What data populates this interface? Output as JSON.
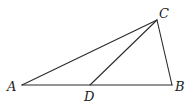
{
  "diagram": {
    "type": "triangle",
    "points": {
      "A": {
        "label": "A",
        "x": 22,
        "y": 85,
        "lx": 7,
        "ly": 91
      },
      "B": {
        "label": "B",
        "x": 172,
        "y": 85,
        "lx": 175,
        "ly": 91
      },
      "C": {
        "label": "C",
        "x": 157,
        "y": 20,
        "lx": 159,
        "ly": 18
      },
      "D": {
        "label": "D",
        "x": 90,
        "y": 85,
        "lx": 84,
        "ly": 101
      }
    },
    "segments": [
      {
        "from": "A",
        "to": "B"
      },
      {
        "from": "A",
        "to": "C"
      },
      {
        "from": "C",
        "to": "B"
      },
      {
        "from": "C",
        "to": "D"
      }
    ],
    "line_color": "#2b2b2b"
  }
}
